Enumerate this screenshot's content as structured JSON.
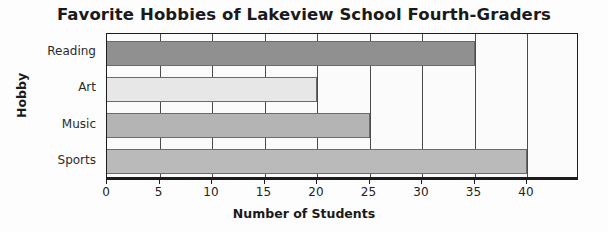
{
  "chart_data": {
    "type": "bar",
    "orientation": "horizontal",
    "title": "Favorite Hobbies of Lakeview School Fourth-Graders",
    "xlabel": "Number of Students",
    "ylabel": "Hobby",
    "categories": [
      "Reading",
      "Art",
      "Music",
      "Sports"
    ],
    "values": [
      35,
      20,
      25,
      40
    ],
    "xlim": [
      0,
      45
    ],
    "xticks": [
      0,
      5,
      10,
      15,
      20,
      25,
      30,
      35,
      40
    ],
    "xtick_labels": [
      "0",
      "5",
      "10",
      "15",
      "20",
      "25",
      "30",
      "35",
      "40"
    ],
    "grid": "vertical",
    "legend": "none",
    "bars": [
      {
        "label": "Reading",
        "value": 35,
        "color": "#909090"
      },
      {
        "label": "Art",
        "value": 20,
        "color": "#e7e7e7"
      },
      {
        "label": "Music",
        "value": 25,
        "color": "#b4b4b4"
      },
      {
        "label": "Sports",
        "value": 40,
        "color": "#bababa"
      }
    ]
  },
  "colors": {
    "background": "#fdfdfd",
    "plot_background": "#fbfbfb",
    "axis": "#1c1c1c",
    "gridline": "#4a4a4a",
    "text": "#1a1a1a"
  }
}
